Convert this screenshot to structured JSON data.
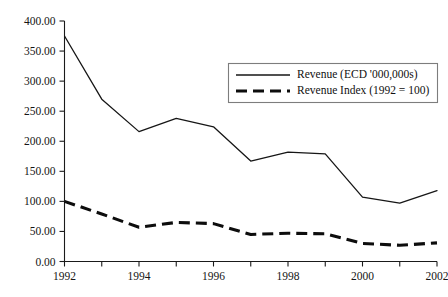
{
  "chart_data": {
    "type": "line",
    "title": "",
    "subtitle": "",
    "xlabel": "",
    "ylabel": "",
    "x": [
      1992,
      1993,
      1994,
      1995,
      1996,
      1997,
      1998,
      1999,
      2000,
      2001,
      2002
    ],
    "categories": [
      "1992",
      "1993",
      "1994",
      "1995",
      "1996",
      "1997",
      "1998",
      "1999",
      "2000",
      "2001",
      "2002"
    ],
    "series": [
      {
        "name": "Revenue (ECD '000,000s)",
        "style": "solid",
        "color": "#161616",
        "values": [
          375,
          270,
          216,
          238,
          224,
          167,
          182,
          179,
          107,
          97,
          118
        ]
      },
      {
        "name": "Revenue Index (1992 = 100)",
        "style": "dashed",
        "color": "#0d0d0d",
        "values": [
          100,
          79,
          57,
          65,
          63,
          45,
          47,
          46,
          30,
          27,
          31
        ]
      }
    ],
    "xlim": [
      1992,
      2002
    ],
    "ylim": [
      0,
      400
    ],
    "y_ticks": [
      0,
      50,
      100,
      150,
      200,
      250,
      300,
      350,
      400
    ],
    "y_tick_labels": [
      "0.00",
      "50.00",
      "100.00",
      "150.00",
      "200.00",
      "250.00",
      "300.00",
      "350.00",
      "400.00"
    ],
    "x_ticks": [
      1992,
      1993,
      1994,
      1995,
      1996,
      1997,
      1998,
      1999,
      2000,
      2001,
      2002
    ],
    "x_tick_labels": [
      "1992",
      "",
      "1994",
      "",
      "1996",
      "",
      "1998",
      "",
      "2000",
      "",
      "2002"
    ],
    "x_labeled_ticks": [
      "1992",
      "1994",
      "1996",
      "1998",
      "2000",
      "2002"
    ],
    "grid": false,
    "legend_position": "upper-right-inside",
    "annotations": []
  },
  "legend": {
    "entries": [
      {
        "label": "Revenue (ECD '000,000s)",
        "style": "solid"
      },
      {
        "label": "Revenue Index (1992 = 100)",
        "style": "dashed"
      }
    ]
  },
  "axes": {
    "y_labels": [
      "400.00",
      "350.00",
      "300.00",
      "250.00",
      "200.00",
      "150.00",
      "100.00",
      "50.00",
      "0.00"
    ],
    "x_labels": [
      "1992",
      "1994",
      "1996",
      "1998",
      "2000",
      "2002"
    ]
  }
}
